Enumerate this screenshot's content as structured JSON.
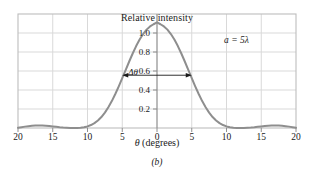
{
  "figure": {
    "caption": "(b)",
    "title": "Relative intensity",
    "x_axis_label_symbol": "θ",
    "x_axis_label_units": "(degrees)",
    "annotation_a": "a = 5λ",
    "annotation_delta": "Δθ"
  },
  "colors": {
    "curve": "#8e8e8e",
    "grid": "#d9d9d9",
    "frame": "#bdbdbd",
    "axis": "#8e8e8e",
    "text": "#1a1a1a",
    "background": "#ffffff"
  },
  "chart_data": {
    "type": "line",
    "title": "Relative intensity",
    "subtitle": "(b)",
    "xlabel": "θ (degrees)",
    "ylabel": "Relative intensity",
    "xlim": [
      -20,
      20
    ],
    "ylim": [
      0,
      1.08
    ],
    "grid": true,
    "legend": null,
    "annotations": [
      {
        "text": "a = 5λ",
        "x": 13.5,
        "y": 0.93
      },
      {
        "text": "Δθ",
        "x": -4.2,
        "y": 0.5,
        "kind": "double-arrow",
        "x_start": -5.0,
        "x_end": 5.0,
        "y_level": 0.5
      }
    ],
    "x_ticks": [
      -20,
      -15,
      -10,
      -5,
      0,
      5,
      10,
      15,
      20
    ],
    "x_tick_labels": [
      "20",
      "15",
      "10",
      "5",
      "0",
      "5",
      "10",
      "15",
      "20"
    ],
    "y_ticks": [
      0.2,
      0.4,
      0.6,
      0.8,
      1.0
    ],
    "y_tick_labels": [
      "0.2",
      "0.4",
      "0.6",
      "0.8",
      "1.0"
    ],
    "formula": "I/Im = (sin(alpha)/alpha)^2, alpha = pi*(a/lambda)*sin(theta), a/lambda = 5",
    "series": [
      {
        "name": "Relative intensity",
        "x": [
          -20,
          -19.5,
          -19,
          -18.5,
          -18,
          -17.5,
          -17,
          -16.5,
          -16,
          -15.5,
          -15,
          -14.5,
          -14,
          -13.5,
          -13,
          -12.5,
          -12,
          -11.5,
          -11,
          -10.5,
          -10,
          -9.5,
          -9,
          -8.5,
          -8,
          -7.5,
          -7,
          -6.5,
          -6,
          -5.5,
          -5,
          -4.5,
          -4,
          -3.5,
          -3,
          -2.5,
          -2,
          -1.5,
          -1,
          -0.5,
          0,
          0.5,
          1,
          1.5,
          2,
          2.5,
          3,
          3.5,
          4,
          4.5,
          5,
          5.5,
          6,
          6.5,
          7,
          7.5,
          8,
          8.5,
          9,
          9.5,
          10,
          10.5,
          11,
          11.5,
          12,
          12.5,
          13,
          13.5,
          14,
          14.5,
          15,
          15.5,
          16,
          16.5,
          17,
          17.5,
          18,
          18.5,
          19,
          19.5,
          20
        ],
        "y": [
          0.003,
          0.008,
          0.013,
          0.017,
          0.021,
          0.023,
          0.024,
          0.024,
          0.022,
          0.019,
          0.015,
          0.011,
          0.007,
          0.004,
          0.002,
          0.0004,
          0.0,
          0.001,
          0.003,
          0.008,
          0.015,
          0.028,
          0.046,
          0.071,
          0.104,
          0.146,
          0.196,
          0.255,
          0.322,
          0.395,
          0.472,
          0.551,
          0.63,
          0.706,
          0.776,
          0.838,
          0.89,
          0.932,
          0.962,
          0.983,
          1.0,
          0.983,
          0.962,
          0.932,
          0.89,
          0.838,
          0.776,
          0.706,
          0.63,
          0.551,
          0.472,
          0.395,
          0.322,
          0.255,
          0.196,
          0.146,
          0.104,
          0.071,
          0.046,
          0.028,
          0.015,
          0.008,
          0.003,
          0.001,
          0.0,
          0.0004,
          0.002,
          0.004,
          0.007,
          0.011,
          0.015,
          0.019,
          0.022,
          0.024,
          0.024,
          0.023,
          0.021,
          0.017,
          0.013,
          0.008,
          0.003
        ]
      }
    ]
  }
}
